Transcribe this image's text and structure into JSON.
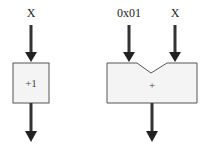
{
  "diagram": {
    "left_block": {
      "input_label": "X",
      "operation": "+1"
    },
    "right_block": {
      "input_labels": [
        "0x01",
        "X"
      ],
      "operation": "+"
    },
    "colors": {
      "stroke": "#333333",
      "box_fill": "#f4f4f4",
      "arrow": "#333333"
    }
  }
}
